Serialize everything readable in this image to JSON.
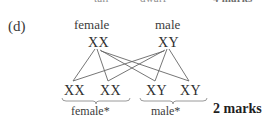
{
  "page": {
    "background_color": "#ffffff",
    "width": 277,
    "height": 119
  },
  "clipped_top_row": {
    "phenotype_left": "tall",
    "phenotype_right": "dwarf",
    "marks": "4 marks"
  },
  "question": {
    "part_label": "(d)",
    "marks": "2 marks"
  },
  "cross_diagram": {
    "parents": {
      "left": {
        "sex": "female",
        "genotype": "XX"
      },
      "right": {
        "sex": "male",
        "genotype": "XY"
      }
    },
    "offspring": [
      {
        "genotype": "XX"
      },
      {
        "genotype": "XX"
      },
      {
        "genotype": "XY"
      },
      {
        "genotype": "XY"
      }
    ],
    "groups": [
      {
        "label": "female*"
      },
      {
        "label": "male*"
      }
    ],
    "line_color": "#666666",
    "brace_color": "#9a9a9a",
    "text_color": "#303030"
  }
}
